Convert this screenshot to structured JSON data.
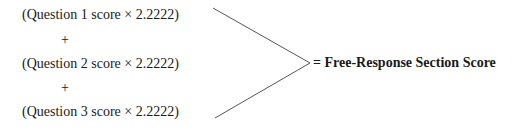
{
  "formula": {
    "terms": [
      {
        "label": "(Question 1 score × 2.2222)"
      },
      {
        "label": "(Question 2 score × 2.2222)"
      },
      {
        "label": "(Question 3 score × 2.2222)"
      }
    ],
    "operators": [
      "+",
      "+"
    ],
    "result": "= Free-Response Section Score"
  },
  "colors": {
    "text": "#1a1a1a",
    "line": "#555555"
  }
}
